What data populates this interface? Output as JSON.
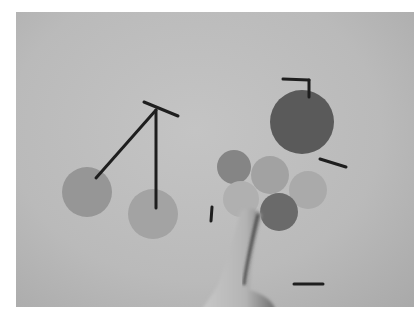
{
  "scene": {
    "description": "Grayscale photo of a tabletop touch surface showing circles, line segments, and a finger touching the surface",
    "background_color": "#bdbdbd",
    "circles": [
      {
        "id": "left-a",
        "cx": 87,
        "cy": 192,
        "r": 25,
        "color": "#969696"
      },
      {
        "id": "left-b",
        "cx": 153,
        "cy": 214,
        "r": 25,
        "color": "#a3a3a3"
      },
      {
        "id": "top-right-dark",
        "cx": 302,
        "cy": 122,
        "r": 32,
        "color": "#5a5a5a"
      },
      {
        "id": "cluster-1",
        "cx": 234,
        "cy": 167,
        "r": 17,
        "color": "#858585"
      },
      {
        "id": "cluster-2",
        "cx": 270,
        "cy": 175,
        "r": 19,
        "color": "#a2a2a2"
      },
      {
        "id": "cluster-3",
        "cx": 308,
        "cy": 190,
        "r": 19,
        "color": "#aaaaaa"
      },
      {
        "id": "cluster-4",
        "cx": 241,
        "cy": 199,
        "r": 18,
        "color": "#b0b0b0"
      },
      {
        "id": "cluster-5",
        "cx": 279,
        "cy": 212,
        "r": 19,
        "color": "#6a6a6a"
      }
    ],
    "lines": [
      {
        "x1": 144,
        "y1": 102,
        "x2": 178,
        "y2": 116
      },
      {
        "x1": 156,
        "y1": 110,
        "x2": 96,
        "y2": 178
      },
      {
        "x1": 156,
        "y1": 110,
        "x2": 156,
        "y2": 208
      },
      {
        "x1": 283,
        "y1": 79,
        "x2": 309,
        "y2": 80
      },
      {
        "x1": 309,
        "y1": 80,
        "x2": 309,
        "y2": 97
      },
      {
        "x1": 320,
        "y1": 159,
        "x2": 346,
        "y2": 167
      },
      {
        "x1": 212,
        "y1": 207,
        "x2": 211,
        "y2": 221
      },
      {
        "x1": 294,
        "y1": 284,
        "x2": 323,
        "y2": 284
      }
    ],
    "finger": {
      "present": true,
      "touch_point": {
        "x": 254,
        "y": 210
      }
    }
  }
}
